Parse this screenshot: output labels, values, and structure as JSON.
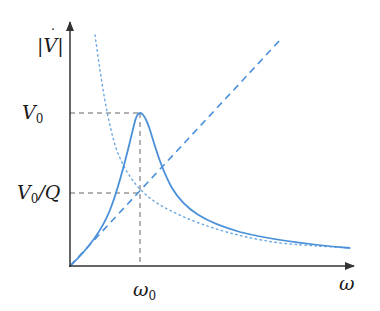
{
  "diagram": {
    "y_axis_label": "|V̇|",
    "x_axis_label": "ω",
    "labels": {
      "v0_base": "V",
      "v0_sub": "0",
      "v0q_base": "V",
      "v0q_sub": "0",
      "v0q_suffix": "/Q",
      "omega0_base": "ω",
      "omega0_sub": "0",
      "v_dot": "V",
      "omega": "ω"
    },
    "curves": [
      {
        "name": "resonance-curve",
        "style": "solid",
        "color": "#4a90d9"
      },
      {
        "name": "low-frequency-asymptote",
        "style": "dashed",
        "color": "#4a90d9"
      },
      {
        "name": "high-frequency-asymptote",
        "style": "dotted",
        "color": "#4a90d9"
      }
    ],
    "guide_lines": [
      {
        "name": "v0-level",
        "style": "dashed",
        "color": "#555555"
      },
      {
        "name": "v0q-level",
        "style": "dashed",
        "color": "#555555"
      },
      {
        "name": "omega0-vertical",
        "style": "dashed",
        "color": "#555555"
      }
    ],
    "colors": {
      "curve": "#4a90d9",
      "axis": "#333333",
      "guide": "#666666"
    }
  }
}
